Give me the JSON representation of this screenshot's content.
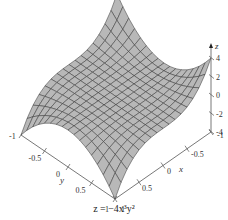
{
  "chart_data": {
    "type": "surface3d",
    "title": "z = −4x³y²",
    "function": "z = -4*x^3*y^2",
    "xlabel": "x",
    "ylabel": "y",
    "zlabel": "z",
    "x_range": [
      -1,
      1
    ],
    "y_range": [
      -1,
      1
    ],
    "z_range": [
      -4,
      4
    ],
    "x_ticks": [
      "-1",
      "-0.5",
      "0",
      "0.5",
      "1"
    ],
    "y_ticks": [
      "-1",
      "-0.5",
      "0",
      "0.5",
      "1"
    ],
    "z_ticks": [
      "4",
      "2",
      "0",
      "-2",
      "-4"
    ],
    "grid_divisions": 16,
    "surface_color": "#b8b8b8",
    "mesh_color": "#333333",
    "corner_values": [
      {
        "x": -1,
        "y": -1,
        "z": 4
      },
      {
        "x": -1,
        "y": 1,
        "z": 4
      },
      {
        "x": 1,
        "y": -1,
        "z": -4
      },
      {
        "x": 1,
        "y": 1,
        "z": -4
      }
    ]
  },
  "caption": "z = −4x³y²"
}
